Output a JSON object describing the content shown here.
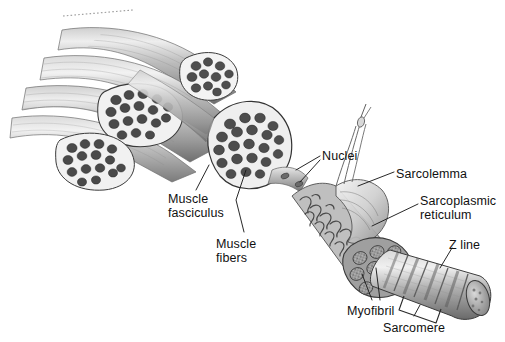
{
  "figure": {
    "background": "#ffffff",
    "ink": "#111111",
    "palette": {
      "muscle_light": "#e2e2e2",
      "muscle_mid": "#b8b8b8",
      "muscle_dark": "#8d8d8d",
      "muscle_shadow": "#5f5f5f",
      "fiber_dot": "#4a4a4a",
      "perimysium": "#f1f1f1",
      "outline": "#2b2b2b"
    }
  },
  "labels": [
    {
      "id": "muscle-fasciculus",
      "text": "Muscle\nfasciculus",
      "x": 168,
      "y": 193
    },
    {
      "id": "muscle-fibers",
      "text": "Muscle\nfibers",
      "x": 216,
      "y": 238
    },
    {
      "id": "nuclei",
      "text": "Nuclei",
      "x": 322,
      "y": 150
    },
    {
      "id": "sarcolemma",
      "text": "Sarcolemma",
      "x": 396,
      "y": 168
    },
    {
      "id": "sarcoplasmic-reticulum",
      "text": "Sarcoplasmic\nreticulum",
      "x": 420,
      "y": 195
    },
    {
      "id": "z-line",
      "text": "Z line",
      "x": 449,
      "y": 239
    },
    {
      "id": "myofibril",
      "text": "Myofibril",
      "x": 347,
      "y": 305
    },
    {
      "id": "sarcomere",
      "text": "Sarcomere",
      "x": 383,
      "y": 322
    }
  ],
  "structures": [
    {
      "id": "muscle-belly",
      "description": "bundle of striated fasciculi, cut obliquely"
    },
    {
      "id": "fascicle-cross-section",
      "description": "cut faces showing packed muscle fibers"
    },
    {
      "id": "single-muscle-fiber",
      "description": "enlarged fiber with peeled sarcolemma"
    },
    {
      "id": "sarcolemma-sheath",
      "description": "translucent membrane pulled back"
    },
    {
      "id": "sarcoplasmic-reticulum-network",
      "description": "tubular network over myofibrils"
    },
    {
      "id": "myofibril-bundle",
      "description": "round myofibrils in cut end"
    },
    {
      "id": "striated-myofibril",
      "description": "banded cylinder with Z lines and sarcomeres"
    },
    {
      "id": "cut-indicator",
      "description": "dotted line at top edge"
    }
  ]
}
